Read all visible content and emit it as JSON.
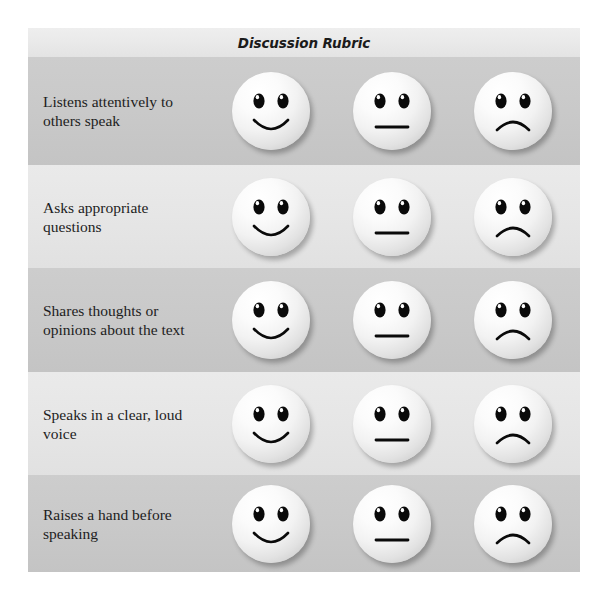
{
  "rubric": {
    "title": "Discussion Rubric",
    "columns": [
      "happy-face",
      "neutral-face",
      "sad-face"
    ],
    "rows": [
      {
        "label": "Listens attentively to others speak",
        "ratings": [
          "happy",
          "neutral",
          "sad"
        ],
        "shade": "dark"
      },
      {
        "label": "Asks appropriate questions",
        "ratings": [
          "happy",
          "neutral",
          "sad"
        ],
        "shade": "light"
      },
      {
        "label": "Shares thoughts or opinions about the text",
        "ratings": [
          "happy",
          "neutral",
          "sad"
        ],
        "shade": "dark"
      },
      {
        "label": "Speaks in a clear, loud voice",
        "ratings": [
          "happy",
          "neutral",
          "sad"
        ],
        "shade": "light"
      },
      {
        "label": "Raises a hand before speaking",
        "ratings": [
          "happy",
          "neutral",
          "sad"
        ],
        "shade": "dark"
      }
    ]
  },
  "colors": {
    "page_background": "#ffffff",
    "title_band": "#e9e9e9",
    "row_dark": "#c9c9c9",
    "row_light": "#e6e6e6",
    "text": "#1d1d1d",
    "face_fill": "#f2f2f2",
    "face_features": "#000000"
  },
  "layout": {
    "row_tops": [
      29,
      137,
      240,
      344,
      447
    ],
    "row_heights": [
      108,
      103,
      104,
      103,
      97
    ]
  }
}
